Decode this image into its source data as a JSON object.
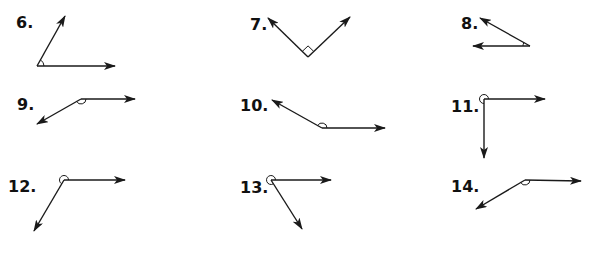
{
  "colors": {
    "ink": "#1a1a1a",
    "background": "#ffffff"
  },
  "problems": [
    {
      "number": "6.",
      "label_pos": [
        16,
        15
      ],
      "vertex": [
        37,
        66
      ],
      "rays": [
        [
          65,
          16
        ],
        [
          115,
          66
        ]
      ],
      "marker": "arc-small"
    },
    {
      "number": "7.",
      "label_pos": [
        250,
        17
      ],
      "vertex": [
        308,
        57
      ],
      "rays": [
        [
          268,
          18
        ],
        [
          350,
          17
        ]
      ],
      "marker": "right-angle-square"
    },
    {
      "number": "8.",
      "label_pos": [
        461,
        16
      ],
      "vertex": [
        530,
        46
      ],
      "rays": [
        [
          480,
          18
        ],
        [
          473,
          46
        ]
      ],
      "marker": "arc-small"
    },
    {
      "number": "9.",
      "label_pos": [
        17,
        97
      ],
      "vertex": [
        81,
        99
      ],
      "rays": [
        [
          135,
          99
        ],
        [
          37,
          124
        ]
      ],
      "marker": "arc-reflex-below"
    },
    {
      "number": "10.",
      "label_pos": [
        240,
        98
      ],
      "vertex": [
        322,
        128
      ],
      "rays": [
        [
          272,
          100
        ],
        [
          385,
          128
        ]
      ],
      "marker": "arc-obtuse-above"
    },
    {
      "number": "11.",
      "label_pos": [
        451,
        99
      ],
      "vertex": [
        484,
        99
      ],
      "rays": [
        [
          545,
          99
        ],
        [
          484,
          158
        ]
      ],
      "marker": "circle-reflex"
    },
    {
      "number": "12.",
      "label_pos": [
        8,
        179
      ],
      "vertex": [
        64,
        180
      ],
      "rays": [
        [
          125,
          180
        ],
        [
          34,
          231
        ]
      ],
      "marker": "circle-reflex"
    },
    {
      "number": "13.",
      "label_pos": [
        240,
        180
      ],
      "vertex": [
        271,
        180
      ],
      "rays": [
        [
          331,
          180
        ],
        [
          302,
          229
        ]
      ],
      "marker": "circle-reflex"
    },
    {
      "number": "14.",
      "label_pos": [
        451,
        179
      ],
      "vertex": [
        525,
        180
      ],
      "rays": [
        [
          581,
          181
        ],
        [
          476,
          209
        ]
      ],
      "marker": "arc-obtuse-above"
    }
  ]
}
